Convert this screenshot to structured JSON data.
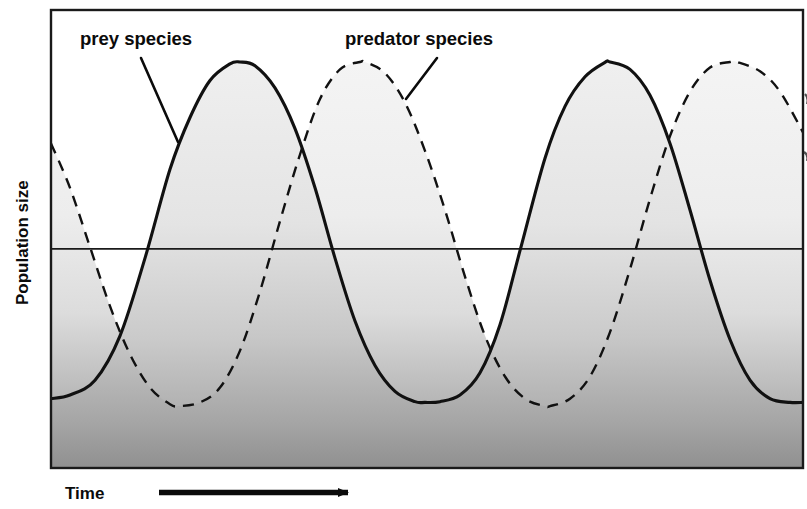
{
  "figure": {
    "kind": "predator-prey population oscillation diagram",
    "background_color": "#ffffff",
    "frame_color": "#1a1a1a",
    "prey_line_color": "#111111",
    "predator_line_color": "#111111",
    "fill_top_color": "#f0f0f0",
    "fill_bottom_color": "#9a9a9a"
  },
  "axes": {
    "y_label": "Population size",
    "x_label": "Time",
    "x_arrow_icon": "right-arrow-icon",
    "reference_line_visible": true,
    "frame": {
      "left": 51,
      "top": 10,
      "right": 803,
      "bottom": 468
    }
  },
  "annotations": [
    {
      "id": "prey",
      "label": "prey species",
      "label_x": 80,
      "label_y": 45,
      "leader_from_x": 141,
      "leader_from_y": 58,
      "leader_to_x": 178,
      "leader_to_y": 142
    },
    {
      "id": "predator",
      "label": "predator species",
      "label_x": 345,
      "label_y": 45,
      "leader_from_x": 437,
      "leader_from_y": 58,
      "leader_to_x": 406,
      "leader_to_y": 99
    }
  ],
  "chart_data": {
    "type": "line",
    "title": "",
    "xlabel": "Time",
    "ylabel": "Population size",
    "xlim": [
      0,
      807
    ],
    "ylim": [
      0,
      1
    ],
    "grid": false,
    "legend": "inline-annotations",
    "axis_ticks": {
      "x": [],
      "y": []
    },
    "reference_line_y": 0.495,
    "series": [
      {
        "name": "prey species",
        "style": "solid",
        "phase_offset_fraction": 0.0,
        "period_px": 370,
        "peak_value": 1.0,
        "trough_value": 0.08,
        "peaks_x": [
          240,
          610
        ],
        "troughs_x": [
          425,
          55
        ],
        "points_x": [
          51,
          70,
          95,
          120,
          145,
          170,
          190,
          210,
          230,
          240,
          255,
          275,
          295,
          315,
          335,
          355,
          375,
          395,
          415,
          425,
          440,
          460,
          480,
          500,
          520,
          545,
          565,
          585,
          605,
          610,
          630,
          650,
          670,
          690,
          710,
          730,
          750,
          770,
          790,
          803
        ],
        "points_y": [
          0.09,
          0.1,
          0.14,
          0.26,
          0.47,
          0.71,
          0.85,
          0.95,
          0.995,
          1.0,
          0.99,
          0.93,
          0.82,
          0.66,
          0.47,
          0.3,
          0.18,
          0.11,
          0.082,
          0.08,
          0.082,
          0.1,
          0.16,
          0.29,
          0.49,
          0.74,
          0.88,
          0.96,
          0.999,
          1.0,
          0.98,
          0.91,
          0.78,
          0.6,
          0.41,
          0.25,
          0.14,
          0.09,
          0.08,
          0.08
        ]
      },
      {
        "name": "predator species",
        "style": "dashed",
        "phase_offset_fraction": 0.33,
        "period_px": 370,
        "peak_value": 1.0,
        "trough_value": 0.07,
        "peaks_x": [
          365,
          737
        ],
        "troughs_x": [
          180,
          550
        ],
        "points_x": [
          51,
          70,
          90,
          110,
          130,
          150,
          170,
          180,
          200,
          220,
          240,
          260,
          280,
          300,
          320,
          340,
          360,
          365,
          385,
          405,
          425,
          445,
          465,
          485,
          505,
          525,
          545,
          550,
          570,
          590,
          610,
          630,
          650,
          670,
          690,
          710,
          730,
          737,
          760,
          780,
          803
        ],
        "points_y": [
          0.78,
          0.66,
          0.5,
          0.34,
          0.21,
          0.12,
          0.075,
          0.07,
          0.08,
          0.12,
          0.22,
          0.38,
          0.57,
          0.75,
          0.9,
          0.98,
          1.0,
          1.0,
          0.97,
          0.89,
          0.76,
          0.6,
          0.42,
          0.26,
          0.15,
          0.09,
          0.07,
          0.07,
          0.09,
          0.15,
          0.27,
          0.44,
          0.63,
          0.8,
          0.92,
          0.985,
          1.0,
          1.0,
          0.975,
          0.92,
          0.81
        ]
      }
    ]
  }
}
